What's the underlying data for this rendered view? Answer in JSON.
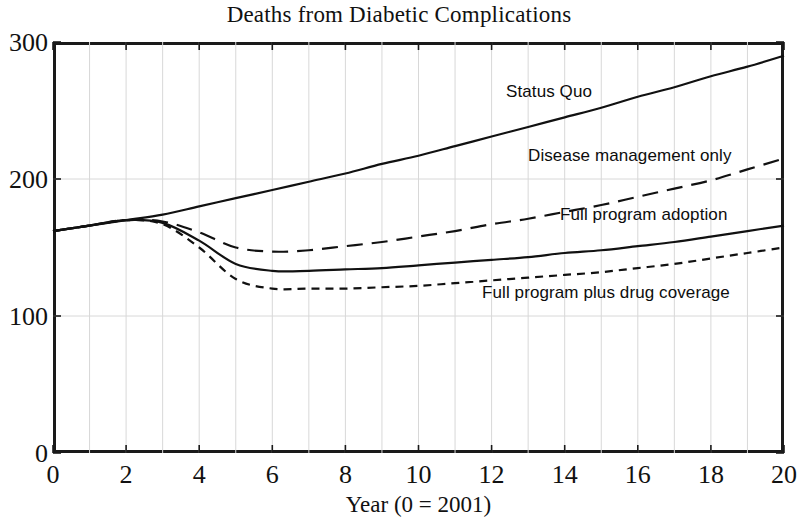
{
  "chart_data": {
    "type": "line",
    "title": "Deaths from Diabetic Complications",
    "xlabel": "Year (0 = 2001)",
    "ylabel": "",
    "xlim": [
      0,
      20
    ],
    "ylim": [
      0,
      300
    ],
    "xticks": [
      0,
      2,
      4,
      6,
      8,
      10,
      12,
      14,
      16,
      18,
      20
    ],
    "yticks": [
      0,
      100,
      200,
      300
    ],
    "grid": "both-light-gray-minor-x-every-1",
    "legend": "inline-annotations",
    "x": [
      0,
      1,
      2,
      3,
      4,
      5,
      6,
      7,
      8,
      9,
      10,
      11,
      12,
      13,
      14,
      15,
      16,
      17,
      18,
      19,
      20
    ],
    "series": [
      {
        "name": "Status Quo",
        "style": "solid",
        "color": "#111111",
        "values": [
          162,
          166,
          170,
          174,
          180,
          186,
          192,
          198,
          204,
          211,
          217,
          224,
          231,
          238,
          245,
          252,
          260,
          267,
          275,
          282,
          290
        ]
      },
      {
        "name": "Disease management only",
        "style": "long-dash",
        "color": "#111111",
        "values": [
          162,
          166,
          170,
          169,
          161,
          150,
          147,
          148,
          151,
          154,
          158,
          162,
          167,
          171,
          176,
          181,
          187,
          193,
          199,
          207,
          215
        ]
      },
      {
        "name": "Full program adoption",
        "style": "solid",
        "color": "#111111",
        "values": [
          162,
          166,
          170,
          168,
          155,
          138,
          133,
          133,
          134,
          135,
          137,
          139,
          141,
          143,
          146,
          148,
          151,
          154,
          158,
          162,
          166
        ]
      },
      {
        "name": "Full program plus drug coverage",
        "style": "short-dash",
        "color": "#111111",
        "values": [
          162,
          166,
          170,
          167,
          150,
          127,
          120,
          120,
          120,
          121,
          122,
          124,
          126,
          128,
          130,
          132,
          135,
          138,
          142,
          146,
          150
        ]
      }
    ],
    "annotations": [
      {
        "text": "Status Quo",
        "x": 12.4,
        "y": 248
      },
      {
        "text": "Disease management only",
        "x": 13.0,
        "y": 201
      },
      {
        "text": "Full program adoption",
        "x": 13.9,
        "y": 158
      },
      {
        "text": "Full program plus drug coverage",
        "x": 11.8,
        "y": 100
      }
    ]
  },
  "axes": {
    "x_tick_labels": [
      "0",
      "2",
      "4",
      "6",
      "8",
      "10",
      "12",
      "14",
      "16",
      "18",
      "20"
    ],
    "y_tick_labels": [
      "0",
      "100",
      "200",
      "300"
    ],
    "x_axis_label": "Year (0 = 2001)"
  },
  "labels": {
    "title": "Deaths from Diabetic Complications",
    "status_quo": "Status Quo",
    "disease_management_only": "Disease management only",
    "full_program_adoption": "Full program adoption",
    "full_program_plus_drug_coverage": "Full program plus drug coverage"
  },
  "colors": {
    "line": "#111111",
    "frame": "#1a1a1a",
    "grid": "#d8d8d8",
    "background": "#ffffff"
  }
}
